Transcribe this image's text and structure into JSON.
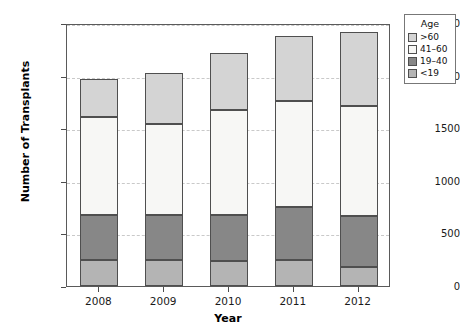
{
  "chart_data": {
    "type": "bar",
    "stacked": true,
    "title": "",
    "xlabel": "Year",
    "ylabel": "Number of Transplants",
    "categories": [
      "2008",
      "2009",
      "2010",
      "2011",
      "2012"
    ],
    "ylim": [
      0,
      2500
    ],
    "yticks": [
      0,
      500,
      1000,
      1500,
      2000,
      2500
    ],
    "grid": true,
    "grid_style": "dashed horizontal",
    "legend_title": "Age",
    "legend_position": "outside right top",
    "stack_order_bottom_to_top": [
      "<19",
      "19-40",
      "41-60",
      ">60"
    ],
    "series": [
      {
        "name": "<19",
        "label": "<19",
        "color": "#b4b4b4",
        "values": [
          247,
          247,
          240,
          247,
          180
        ]
      },
      {
        "name": "19-40",
        "label": "19–40",
        "color": "#878787",
        "values": [
          428,
          428,
          435,
          503,
          485
        ]
      },
      {
        "name": "41-60",
        "label": "41–60",
        "color": "#f7f7f5",
        "values": [
          935,
          865,
          1000,
          1010,
          1050
        ]
      },
      {
        "name": ">60",
        "label": ">60",
        "color": "#d4d4d4",
        "values": [
          360,
          485,
          540,
          620,
          700
        ]
      }
    ],
    "totals": [
      1970,
      2025,
      2215,
      2380,
      2415
    ]
  },
  "legend": {
    "title": "Age",
    "entries": [
      {
        "label": ">60",
        "color": "#d4d4d4"
      },
      {
        "label": "41–60",
        "color": "#f7f7f5"
      },
      {
        "label": "19–40",
        "color": "#878787"
      },
      {
        "label": "<19",
        "color": "#b4b4b4"
      }
    ]
  },
  "axes": {
    "x_label": "Year",
    "y_label": "Number of Transplants",
    "y_tick_labels": [
      "0",
      "500",
      "1000",
      "1500",
      "2000",
      "2500"
    ],
    "x_tick_labels": [
      "2008",
      "2009",
      "2010",
      "2011",
      "2012"
    ]
  },
  "colors": {
    "frame": "#5a5a5a",
    "grid": "#c9c9c9",
    "bar_outline": "#4f6f4f",
    "background": "#ffffff"
  }
}
